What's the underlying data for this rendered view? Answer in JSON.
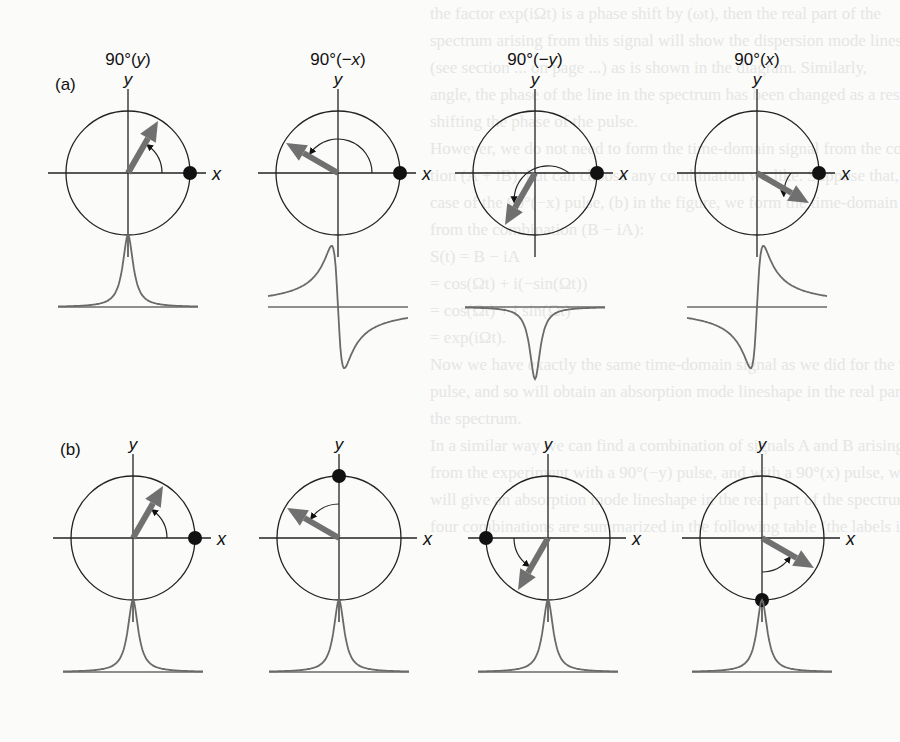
{
  "figure": {
    "row_a": {
      "label": "(a)",
      "panels": [
        {
          "title": "90°(y)",
          "title_main": "90°(",
          "title_axis": "y",
          "title_end": ")",
          "arrow_angle_deg": 60,
          "dot": "x+",
          "lineshape": "absorption"
        },
        {
          "title": "90°(−x)",
          "title_main": "90°(−",
          "title_axis": "x",
          "title_end": ")",
          "arrow_angle_deg": 150,
          "dot": "x+",
          "lineshape": "dispersion"
        },
        {
          "title": "90°(−y)",
          "title_main": "90°(−",
          "title_axis": "y",
          "title_end": ")",
          "arrow_angle_deg": 240,
          "dot": "x+",
          "lineshape": "negative-absorption"
        },
        {
          "title": "90°(x)",
          "title_main": "90°(",
          "title_axis": "x",
          "title_end": ")",
          "arrow_angle_deg": 330,
          "dot": "x+",
          "lineshape": "negative-dispersion"
        }
      ]
    },
    "row_b": {
      "label": "(b)",
      "panels": [
        {
          "arrow_angle_deg": 60,
          "dot": "x+",
          "lineshape": "absorption"
        },
        {
          "arrow_angle_deg": 150,
          "dot": "y+",
          "lineshape": "absorption"
        },
        {
          "arrow_angle_deg": 240,
          "dot": "x-",
          "lineshape": "absorption"
        },
        {
          "arrow_angle_deg": 330,
          "dot": "y-",
          "lineshape": "absorption"
        }
      ]
    },
    "axis_labels": {
      "x": "x",
      "y": "y"
    },
    "colors": {
      "line": "#222222",
      "arrow": "#707070",
      "dot": "#111111",
      "trace": "#6a6a6a"
    }
  },
  "bleed_through_text": [
    "the factor exp(iΩt) is a phase shift by (ωt), then the real part of the",
    "spectrum arising from this signal will show the dispersion mode lineshape",
    "(see section ... on page ...) as is shown in the diagram. Similarly,",
    "angle, the phase of the line in the spectrum has been changed as a result of",
    "shifting the phase of the pulse.",
    "However, we do not need to form the time-domain signal from the combina-",
    "tion (A + iB), but can choose any combination we like. Suppose that, for the",
    "case of the 90°(−x) pulse, (b) in the figure, we form the time-domain signal",
    "from the combination (B − iA):",
    "S(t) = B − iA",
    "= cos(Ωt) + i(−sin(Ωt))",
    "= cos(Ωt) + i sin(Ωt)",
    "= exp(iΩt).",
    "Now we have exactly the same time-domain signal as we did for the 90°(y)",
    "pulse, and so will obtain an absorption mode lineshape in the real part of",
    "the spectrum.",
    "In a similar way we can find a combination of signals A and B arising",
    "from the experiment with a 90°(−y) pulse, and with a 90°(x) pulse, which",
    "will give an absorption mode lineshape in the real part of the spectrum. All",
    "four combinations are summarized in the following table (the labels in the"
  ]
}
